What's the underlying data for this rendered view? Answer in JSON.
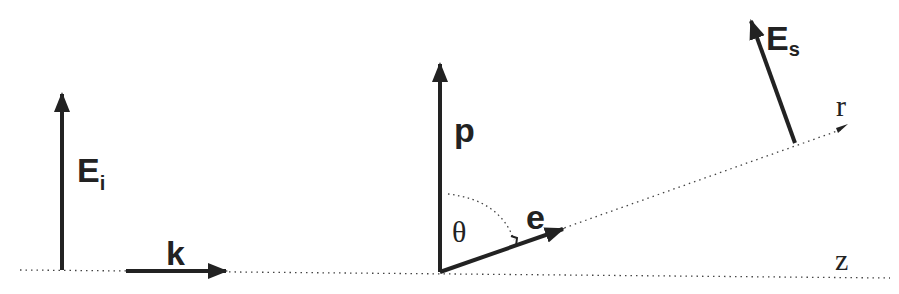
{
  "diagram": {
    "colors": {
      "ink": "#222222",
      "background": "#ffffff"
    },
    "labels": {
      "incident_field": "E",
      "incident_field_sub": "i",
      "wave_vector": "k",
      "dipole": "p",
      "angle": "θ",
      "unit_vector": "e",
      "scattered_field": "E",
      "scattered_field_sub": "s",
      "r_axis": "r",
      "z_axis": "z"
    },
    "elements": [
      {
        "id": "incident-field-arrow",
        "from": [
          62,
          270
        ],
        "to": [
          62,
          92
        ]
      },
      {
        "id": "wave-vector-arrow",
        "from": [
          126,
          271
        ],
        "to": [
          228,
          271
        ]
      },
      {
        "id": "dipole-arrow",
        "from": [
          440,
          272
        ],
        "to": [
          440,
          62
        ]
      },
      {
        "id": "unit-vector-arrow",
        "from": [
          440,
          272
        ],
        "to": [
          565,
          228
        ]
      },
      {
        "id": "scattered-field-arrow",
        "from": [
          795,
          143
        ],
        "to": [
          750,
          18
        ]
      },
      {
        "id": "z-axis-dotted",
        "from": [
          20,
          270
        ],
        "to": [
          890,
          278
        ]
      },
      {
        "id": "r-axis-dotted",
        "from": [
          440,
          272
        ],
        "to": [
          848,
          127
        ]
      }
    ]
  }
}
